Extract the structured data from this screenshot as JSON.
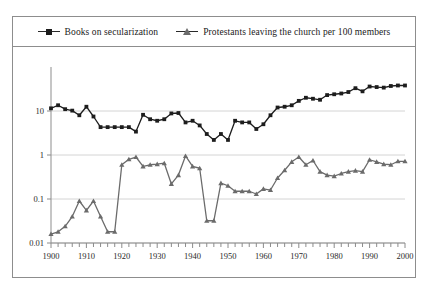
{
  "legend": {
    "position": "top-center",
    "entries": [
      {
        "label": "Books on secularization",
        "marker": "square-marker-icon",
        "color": "#1d1d1d"
      },
      {
        "label": "Protestants leaving the church per 100 members",
        "marker": "triangle-marker-icon",
        "color": "#6b6b6b"
      }
    ]
  },
  "axes": {
    "x_ticks_major": [
      "1900",
      "1910",
      "1920",
      "1930",
      "1940",
      "1950",
      "1960",
      "1970",
      "1980",
      "1990",
      "2000"
    ],
    "y_ticks": [
      "10",
      "1",
      "0.1",
      "0.01"
    ]
  },
  "chart_data": {
    "type": "line",
    "title": "",
    "subtitle": "",
    "xlabel": "",
    "ylabel": "",
    "yscale": "log",
    "ylim": [
      0.01,
      100
    ],
    "xlim": [
      1900,
      2000
    ],
    "grid": true,
    "grid_axis": "y",
    "legend_position": "top-center",
    "x_tick_interval_minor": 2,
    "x_tick_interval_major": 10,
    "y_tick_labels": [
      "10",
      "1",
      "0.1",
      "0.01"
    ],
    "y_tick_values": [
      10,
      1,
      0.1,
      0.01
    ],
    "x": [
      1900,
      1902,
      1904,
      1906,
      1908,
      1910,
      1912,
      1914,
      1916,
      1918,
      1920,
      1922,
      1924,
      1926,
      1928,
      1930,
      1932,
      1934,
      1936,
      1938,
      1940,
      1942,
      1944,
      1946,
      1948,
      1950,
      1952,
      1954,
      1956,
      1958,
      1960,
      1962,
      1964,
      1966,
      1968,
      1970,
      1972,
      1974,
      1976,
      1978,
      1980,
      1982,
      1984,
      1986,
      1988,
      1990,
      1992,
      1994,
      1996,
      1998,
      2000
    ],
    "series": [
      {
        "name": "Books on secularization",
        "marker": "square",
        "color": "#1d1d1d",
        "values": [
          11.5,
          13.5,
          11.0,
          10.2,
          8.0,
          12.5,
          7.5,
          4.3,
          4.3,
          4.3,
          4.3,
          4.3,
          3.4,
          8.2,
          6.5,
          6.0,
          6.5,
          8.8,
          9.0,
          5.5,
          6.0,
          4.7,
          3.0,
          2.2,
          3.0,
          2.2,
          6.0,
          5.5,
          5.5,
          3.9,
          5.0,
          8.0,
          12.0,
          12.5,
          13.5,
          17.0,
          20.0,
          19.0,
          18.0,
          23.0,
          24.0,
          25.0,
          27.0,
          33.0,
          28.0,
          36.0,
          35.0,
          34.0,
          37.0,
          38.0,
          38.0
        ]
      },
      {
        "name": "Protestants leaving the church per 100 members",
        "marker": "triangle",
        "color": "#6b6b6b",
        "values": [
          0.016,
          0.018,
          0.024,
          0.04,
          0.09,
          0.055,
          0.09,
          0.04,
          0.018,
          0.018,
          0.6,
          0.8,
          0.9,
          0.55,
          0.6,
          0.62,
          0.65,
          0.22,
          0.35,
          0.95,
          0.55,
          0.5,
          0.032,
          0.032,
          0.23,
          0.2,
          0.15,
          0.15,
          0.15,
          0.13,
          0.17,
          0.16,
          0.3,
          0.45,
          0.7,
          0.9,
          0.6,
          0.75,
          0.42,
          0.35,
          0.33,
          0.38,
          0.42,
          0.44,
          0.42,
          0.78,
          0.7,
          0.62,
          0.6,
          0.72,
          0.72
        ]
      }
    ]
  }
}
